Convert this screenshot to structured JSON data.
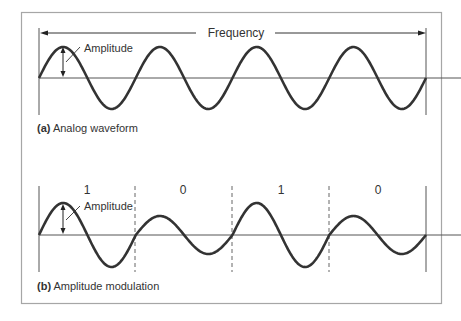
{
  "panel_a": {
    "span_label": "Frequency",
    "amplitude_label": "Amplitude",
    "caption_prefix": "(a)",
    "caption_text": "Analog waveform",
    "cycles": 4
  },
  "panel_b": {
    "amplitude_label": "Amplitude",
    "caption_prefix": "(b)",
    "caption_text": "Amplitude modulation",
    "bits": [
      "1",
      "0",
      "1",
      "0"
    ],
    "high_amplitude": 32,
    "low_amplitude": 19
  },
  "colors": {
    "frame": "#a0a0a0",
    "wave": "#333333",
    "axis": "#555555",
    "text": "#333333"
  }
}
